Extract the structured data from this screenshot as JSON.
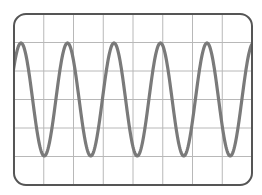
{
  "diagram": {
    "type": "oscilloscope-screen",
    "grid": {
      "columns": 8,
      "rows": 6
    },
    "frame": {
      "x": 14,
      "y": 14,
      "width": 238,
      "height": 171,
      "radius": 12
    },
    "waveform": {
      "shape": "sine",
      "period_px": 46.5,
      "first_peak_x": 21,
      "peak_y": 43,
      "trough_y": 156,
      "cycles_visible": 5.2
    },
    "colors": {
      "background": "#ffffff",
      "grid": "#b8b8b8",
      "frame": "#555555",
      "wave": "#7a7a7a"
    }
  }
}
